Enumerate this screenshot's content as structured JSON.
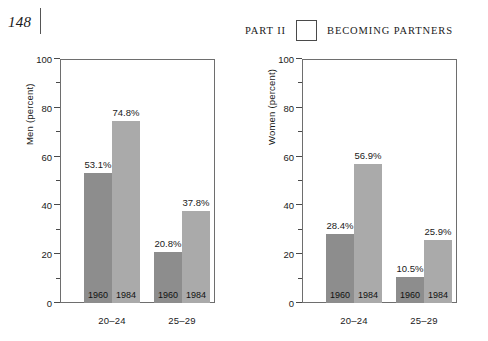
{
  "page": {
    "folio": "148",
    "running_head": {
      "part_label": "PART II",
      "section_label": "BECOMING PARTNERS"
    }
  },
  "chart_data": [
    {
      "id": "men",
      "type": "bar",
      "title": "",
      "xlabel": "",
      "ylabel": "Men (percent)",
      "ylim": [
        0,
        100
      ],
      "ytick_major": [
        0,
        20,
        40,
        60,
        80,
        100
      ],
      "ytick_minor": [
        10,
        30,
        50,
        70,
        90
      ],
      "ytick_labels": [
        "0",
        "20",
        "40",
        "60",
        "80",
        "100"
      ],
      "categories": [
        "20–24",
        "25–29"
      ],
      "grid": false,
      "legend": "in-bar",
      "series": [
        {
          "name": "1960",
          "color": "#8d8d8d",
          "values": [
            53.1,
            20.8
          ],
          "value_labels": [
            "53.1%",
            "20.8%"
          ]
        },
        {
          "name": "1984",
          "color": "#aaaaaa",
          "values": [
            74.8,
            37.8
          ],
          "value_labels": [
            "74.8%",
            "37.8%"
          ]
        }
      ]
    },
    {
      "id": "women",
      "type": "bar",
      "title": "",
      "xlabel": "",
      "ylabel": "Women (percent)",
      "ylim": [
        0,
        100
      ],
      "ytick_major": [
        0,
        20,
        40,
        60,
        80,
        100
      ],
      "ytick_minor": [
        10,
        30,
        50,
        70,
        90
      ],
      "ytick_labels": [
        "0",
        "20",
        "40",
        "60",
        "80",
        "100"
      ],
      "categories": [
        "20–24",
        "25–29"
      ],
      "grid": false,
      "legend": "in-bar",
      "series": [
        {
          "name": "1960",
          "color": "#8d8d8d",
          "values": [
            28.4,
            10.5
          ],
          "value_labels": [
            "28.4%",
            "10.5%"
          ]
        },
        {
          "name": "1984",
          "color": "#aaaaaa",
          "values": [
            56.9,
            25.9
          ],
          "value_labels": [
            "56.9%",
            "25.9%"
          ]
        }
      ]
    }
  ]
}
